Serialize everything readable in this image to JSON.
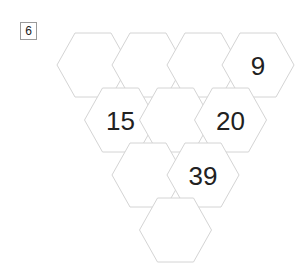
{
  "badge": {
    "label": "6"
  },
  "puzzle": {
    "type": "hexagon-pyramid",
    "geometry": {
      "hex_width": 72,
      "hex_height": 64,
      "col_pitch": 55,
      "row_pitch": 55,
      "origin_x": 57,
      "origin_y": 33,
      "border_color": "#d4d4d4",
      "fill_color": "#ffffff",
      "text_color": "#212121"
    },
    "rows": [
      {
        "index": 0,
        "cells": [
          {
            "id": "r0c0",
            "value": ""
          },
          {
            "id": "r0c1",
            "value": ""
          },
          {
            "id": "r0c2",
            "value": ""
          },
          {
            "id": "r0c3",
            "value": "9"
          }
        ]
      },
      {
        "index": 1,
        "cells": [
          {
            "id": "r1c0",
            "value": "15"
          },
          {
            "id": "r1c1",
            "value": ""
          },
          {
            "id": "r1c2",
            "value": "20"
          }
        ]
      },
      {
        "index": 2,
        "cells": [
          {
            "id": "r2c0",
            "value": ""
          },
          {
            "id": "r2c1",
            "value": "39"
          }
        ]
      },
      {
        "index": 3,
        "cells": [
          {
            "id": "r3c0",
            "value": ""
          }
        ]
      }
    ]
  }
}
